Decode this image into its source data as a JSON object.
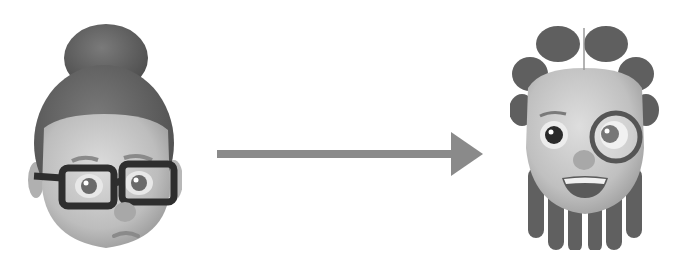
{
  "diagram": {
    "type": "transformation",
    "colors": {
      "background": "#ffffff",
      "arrow": "#8a8a8a",
      "skin": "#c4c4c4",
      "hair": "#5f5f5f",
      "glasses": "#2e2e2e"
    },
    "nodes": [
      {
        "id": "source",
        "label": "",
        "depiction": "memoji with hair bun, thick rectangular glasses, sad expression"
      },
      {
        "id": "target",
        "label": "",
        "depiction": "memoji with braided hair, monocle, smiling expression"
      }
    ],
    "edges": [
      {
        "from": "source",
        "to": "target",
        "style": "solid-arrow",
        "label": ""
      }
    ]
  }
}
